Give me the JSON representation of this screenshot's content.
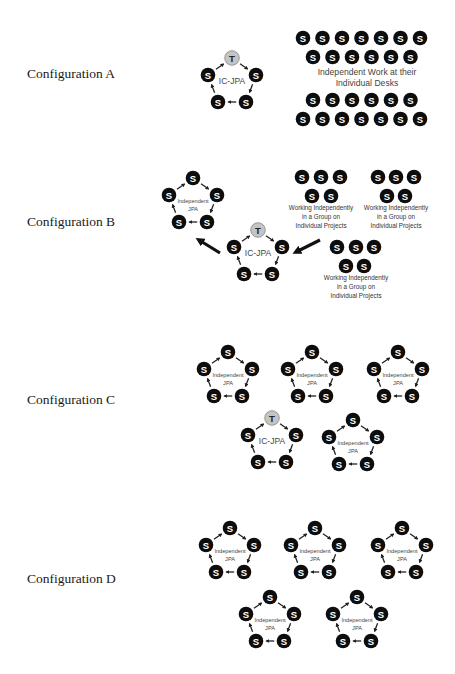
{
  "colors": {
    "student": "#0d0d0d",
    "teacher": "#c4c4c4",
    "text": "#1a1a1a"
  },
  "node_labels": {
    "student": "S",
    "teacher": "T"
  },
  "configurations": [
    {
      "label": "Configuration A",
      "label_pos": [
        27,
        78
      ],
      "pentagons": [
        {
          "type": "IC-JPA",
          "center_label": "IC-JPA",
          "has_teacher": true,
          "top": [
            232,
            58
          ]
        }
      ],
      "desk_grid": {
        "rows": [
          {
            "count": 7,
            "y": 38,
            "x0": 303
          },
          {
            "count": 6,
            "y": 57,
            "x0": 313
          },
          {
            "count": 6,
            "y": 100,
            "x0": 313
          },
          {
            "count": 7,
            "y": 119,
            "x0": 303
          }
        ],
        "spacing": 19.5,
        "caption": [
          "Independent Work at their",
          "Individual Desks"
        ],
        "caption_center": [
          367,
          75
        ]
      }
    },
    {
      "label": "Configuration B",
      "label_pos": [
        27,
        226
      ],
      "pentagons": [
        {
          "type": "Independent JPA",
          "center_label": [
            "Independent",
            "JPA"
          ],
          "has_teacher": false,
          "top": [
            193,
            178
          ]
        },
        {
          "type": "IC-JPA",
          "center_label": "IC-JPA",
          "has_teacher": true,
          "top": [
            258,
            230
          ]
        }
      ],
      "groups": [
        {
          "top_row_x": [
            302,
            321,
            340
          ],
          "bottom_row_x": [
            312,
            331
          ],
          "top_y": 177,
          "bottom_y": 196,
          "caption": [
            "Working Independently",
            "in a Group on",
            "Individual Projects"
          ],
          "caption_x": 321,
          "caption_y": 210
        },
        {
          "top_row_x": [
            378,
            396,
            414
          ],
          "bottom_row_x": [
            387,
            405
          ],
          "top_y": 177,
          "bottom_y": 196,
          "caption": [
            "Working Independently",
            "in a Group on",
            "Individual Projects"
          ],
          "caption_x": 396,
          "caption_y": 210
        },
        {
          "top_row_x": [
            337,
            356,
            374
          ],
          "bottom_row_x": [
            346,
            364
          ],
          "top_y": 247,
          "bottom_y": 266,
          "caption": [
            "Working Independently",
            "in a Group on",
            "Individual Projects"
          ],
          "caption_x": 356,
          "caption_y": 280
        }
      ],
      "arrows": [
        {
          "from": [
            220,
            253
          ],
          "to": [
            199,
            240
          ]
        },
        {
          "from": [
            320,
            240
          ],
          "to": [
            296,
            252
          ]
        }
      ]
    },
    {
      "label": "Configuration C",
      "label_pos": [
        27,
        404
      ],
      "pentagons": [
        {
          "type": "Independent JPA",
          "center_label": [
            "Independent",
            "JPA"
          ],
          "has_teacher": false,
          "top": [
            228,
            352
          ]
        },
        {
          "type": "Independent JPA",
          "center_label": [
            "Independent",
            "JPA"
          ],
          "has_teacher": false,
          "top": [
            312,
            352
          ]
        },
        {
          "type": "Independent JPA",
          "center_label": [
            "Independent",
            "JPA"
          ],
          "has_teacher": false,
          "top": [
            398,
            352
          ]
        },
        {
          "type": "IC-JPA",
          "center_label": "IC-JPA",
          "has_teacher": true,
          "top": [
            272,
            418
          ]
        },
        {
          "type": "Independent JPA",
          "center_label": [
            "Independent",
            "JPA"
          ],
          "has_teacher": false,
          "top": [
            353,
            420
          ]
        }
      ]
    },
    {
      "label": "Configuration D",
      "label_pos": [
        27,
        583
      ],
      "pentagons": [
        {
          "type": "Independent JPA",
          "center_label": [
            "Independent",
            "JPA"
          ],
          "has_teacher": false,
          "top": [
            230,
            528
          ]
        },
        {
          "type": "Independent JPA",
          "center_label": [
            "Independent",
            "JPA"
          ],
          "has_teacher": false,
          "top": [
            315,
            528
          ]
        },
        {
          "type": "Independent JPA",
          "center_label": [
            "Independent",
            "JPA"
          ],
          "has_teacher": false,
          "top": [
            402,
            528
          ]
        },
        {
          "type": "Independent JPA",
          "center_label": [
            "Independent",
            "JPA"
          ],
          "has_teacher": false,
          "top": [
            270,
            597
          ]
        },
        {
          "type": "Independent JPA",
          "center_label": [
            "Independent",
            "JPA"
          ],
          "has_teacher": false,
          "top": [
            357,
            597
          ]
        }
      ]
    }
  ]
}
